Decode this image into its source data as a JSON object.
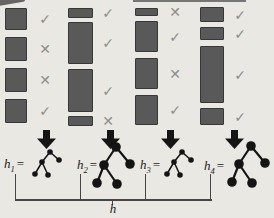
{
  "figure": {
    "brace_label": "h",
    "icons": {
      "check": "✓",
      "cross": "✕"
    },
    "palette": {
      "background": "#e9e8e3",
      "bar_fill": "#595959",
      "bar_border": "#383838",
      "mark_color": "#8d8d8d",
      "arrow_color": "#151515",
      "tree_color": "#141414",
      "bracket_color": "#454545",
      "label_color": "#1c1c1c"
    },
    "groups": [
      {
        "label": {
          "var": "h",
          "sub": "1",
          "eq": "="
        },
        "tree": "small",
        "bars": [
          [
            2,
            22
          ],
          [
            31,
            24
          ],
          [
            62,
            24
          ],
          [
            93,
            24
          ]
        ],
        "marks": [
          "check",
          "cross",
          "cross",
          "check"
        ]
      },
      {
        "label": {
          "var": "h",
          "sub": "2",
          "eq": "="
        },
        "tree": "large",
        "bars": [
          [
            2,
            10
          ],
          [
            16,
            42
          ],
          [
            63,
            43
          ],
          [
            110,
            10
          ]
        ],
        "marks": [
          "check",
          "check",
          "check",
          "cross"
        ]
      },
      {
        "label": {
          "var": "h",
          "sub": "3",
          "eq": "="
        },
        "tree": "small",
        "bars": [
          [
            2,
            8
          ],
          [
            15,
            31
          ],
          [
            52,
            31
          ],
          [
            89,
            30
          ]
        ],
        "marks": [
          "cross",
          "check",
          "cross",
          "check"
        ]
      },
      {
        "label": {
          "var": "h",
          "sub": "4",
          "eq": "="
        },
        "tree": "large",
        "bars": [
          [
            1,
            15
          ],
          [
            21,
            13
          ],
          [
            40,
            57
          ],
          [
            102,
            17
          ]
        ],
        "marks": [
          "check",
          "check",
          "check",
          "check"
        ]
      }
    ],
    "trees": {
      "small": {
        "w": 36,
        "h": 30,
        "r": 2.8,
        "stroke": 1.5,
        "nodes": [
          [
            18,
            4
          ],
          [
            10,
            14
          ],
          [
            27,
            12
          ],
          [
            3,
            26
          ],
          [
            16,
            27
          ]
        ],
        "edges": [
          [
            0,
            1
          ],
          [
            0,
            2
          ],
          [
            1,
            3
          ],
          [
            1,
            4
          ]
        ]
      },
      "large": {
        "w": 48,
        "h": 48,
        "r": 4.8,
        "stroke": 2.2,
        "nodes": [
          [
            24,
            6
          ],
          [
            12,
            24
          ],
          [
            38,
            23
          ],
          [
            5,
            42
          ],
          [
            25,
            43
          ]
        ],
        "edges": [
          [
            0,
            1
          ],
          [
            0,
            2
          ],
          [
            1,
            3
          ],
          [
            1,
            4
          ]
        ]
      }
    }
  }
}
